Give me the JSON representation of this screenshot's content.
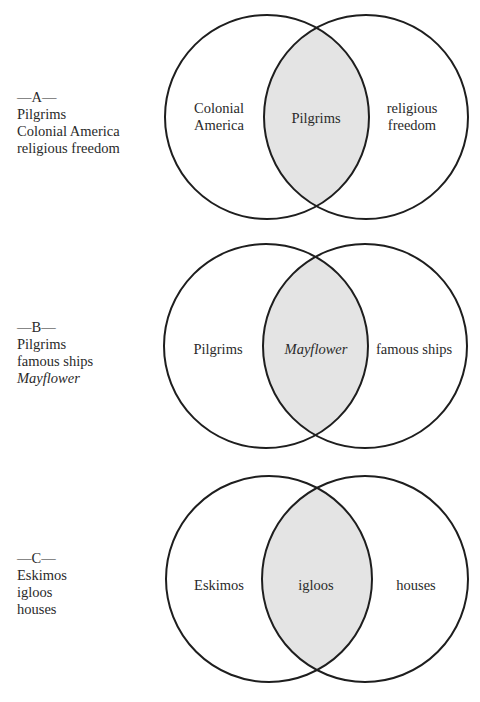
{
  "diagrams": [
    {
      "label": "—A—",
      "terms": [
        "Pilgrims",
        "Colonial America",
        "religious freedom"
      ],
      "left_circle_line1": "Colonial",
      "left_circle_line2": "America",
      "overlap": "Pilgrims",
      "right_circle_line1": "religious",
      "right_circle_line2": "freedom"
    },
    {
      "label": "—B—",
      "terms": [
        "Pilgrims",
        "famous ships",
        "Mayflower"
      ],
      "left_circle": "Pilgrims",
      "overlap": "Mayflower",
      "right_circle": "famous ships"
    },
    {
      "label": "—C—",
      "terms": [
        "Eskimos",
        "igloos",
        "houses"
      ],
      "left_circle": "Eskimos",
      "overlap": "igloos",
      "right_circle": "houses"
    }
  ],
  "colors": {
    "stroke": "#1e1e1e",
    "overlap_fill": "#e4e4e4"
  }
}
